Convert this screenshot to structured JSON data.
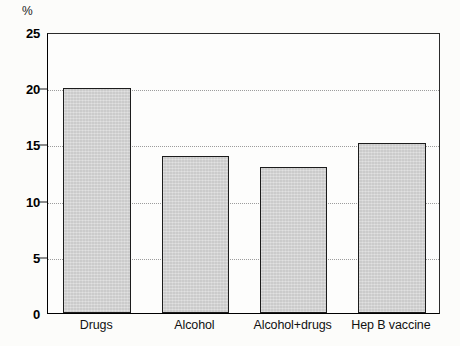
{
  "chart_data": {
    "type": "bar",
    "title": "",
    "subtitle": "",
    "xlabel": "",
    "ylabel": "%",
    "y_unit": "%",
    "categories": [
      "Drugs",
      "Alcohol",
      "Alcohol+drugs",
      "Hep B vaccine"
    ],
    "values": [
      20,
      14,
      13,
      15.1
    ],
    "ylim": [
      0,
      25
    ],
    "yticks": [
      0,
      5,
      10,
      15,
      20,
      25
    ],
    "ytick_labels": [
      "0",
      "5",
      "10",
      "15",
      "20",
      "25"
    ],
    "grid": true,
    "grid_style": "dotted",
    "legend": null,
    "legend_position": "none",
    "bar_fill_color": "#d7d7d7",
    "bar_edge_color": "#1c1c1c",
    "axis_color": "#000000",
    "background_color": "#fcfcfa",
    "annotations": []
  }
}
